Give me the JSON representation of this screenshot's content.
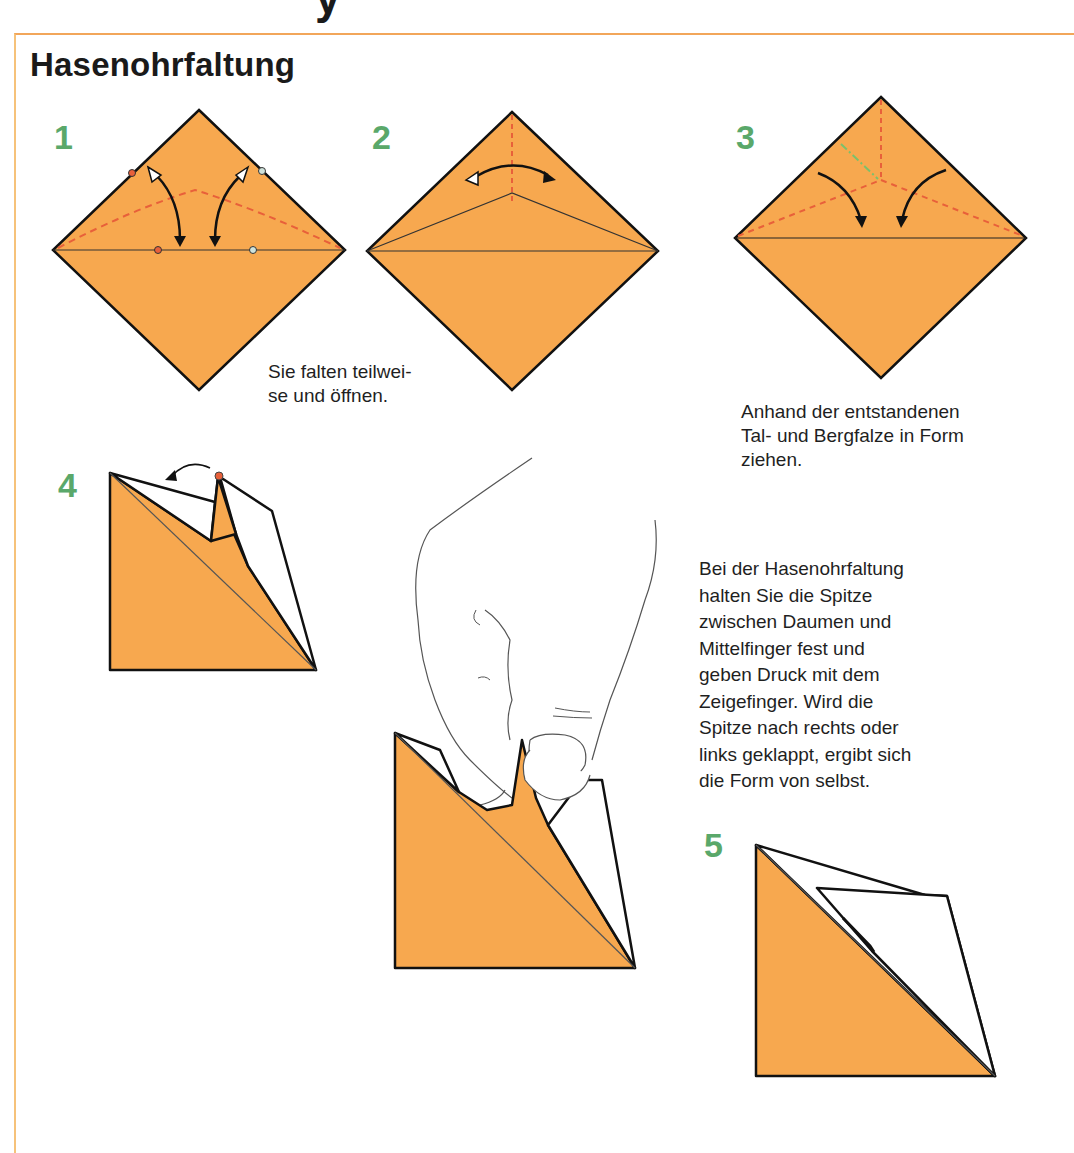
{
  "page": {
    "heading_fragment": "y",
    "title": "Hasenohrfaltung",
    "colors": {
      "paper": "#f7a84f",
      "frame": "#f2a65a",
      "step_number": "#5aa86a",
      "valley_fold": "#e8603a",
      "mountain_fold": "#7cc06b",
      "outline": "#111111"
    }
  },
  "steps": [
    {
      "number": "1"
    },
    {
      "number": "2",
      "caption": "Sie falten teilwei-\nse und öffnen."
    },
    {
      "number": "3",
      "caption": "Anhand der entstandenen\nTal- und Bergfalze in Form\nziehen."
    },
    {
      "number": "4"
    },
    {
      "number": "5"
    }
  ],
  "hand_caption": "Bei der Hasenohrfaltung\nhalten Sie die Spitze\nzwischen Daumen und\nMittelfinger fest und\ngeben Druck mit dem\nZeigefinger. Wird die\nSpitze nach rechts oder\nlinks geklappt, ergibt sich\ndie Form von selbst."
}
